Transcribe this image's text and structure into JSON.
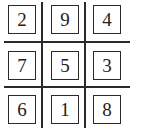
{
  "puzzle": {
    "type": "3x3 magic square",
    "rows": [
      [
        "2",
        "9",
        "4"
      ],
      [
        "7",
        "5",
        "3"
      ],
      [
        "6",
        "1",
        "8"
      ]
    ]
  },
  "colors": {
    "line": "#2a2a2a",
    "text": "#222222",
    "background": "#ffffff"
  }
}
